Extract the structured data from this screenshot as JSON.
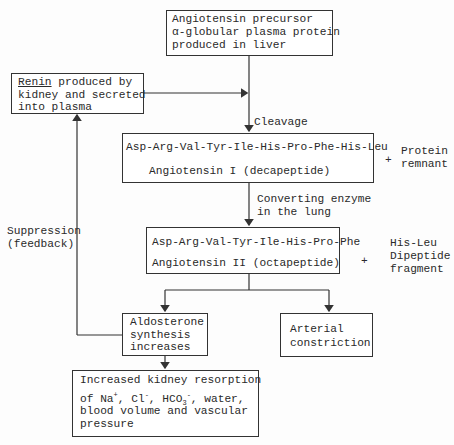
{
  "diagram": {
    "nodes": {
      "precursor": {
        "lines": [
          "Angiotensin precursor",
          "α-globular plasma protein",
          "produced in liver"
        ]
      },
      "renin": {
        "underlined": "Renin",
        "line1_rest": " produced by",
        "lines": [
          "kidney and secreted",
          "into plasma"
        ]
      },
      "angiotensin1": {
        "sequence_main": "Asp-Arg-Val-Tyr-Ile-His-Pro-Phe",
        "sequence_cleaved": "-His-Leu",
        "label": "Angiotensin I (decapeptide)"
      },
      "angiotensin2": {
        "sequence": "Asp-Arg-Val-Tyr-Ile-His-Pro-Phe",
        "label": "Angiotensin II (octapeptide)"
      },
      "aldosterone": {
        "lines": [
          "Aldosterone",
          "synthesis",
          "increases"
        ]
      },
      "arterial": {
        "lines": [
          "Arterial",
          "constriction"
        ]
      },
      "kidney": {
        "line1": "Increased kidney resorption",
        "line2_prefix": "of Na",
        "na_charge": "+",
        "cl": ", Cl",
        "cl_charge": "-",
        "hco": ", HCO",
        "hco_sub": "3",
        "hco_charge": "-",
        "line2_suffix": ", water,",
        "line3": "blood volume and vascular",
        "line4": "pressure"
      }
    },
    "side_products": {
      "protein_remnant": {
        "plus": "+",
        "lines": [
          "Protein",
          "remnant"
        ]
      },
      "his_leu": {
        "plus": "+",
        "lines": [
          "His-Leu",
          "Dipeptide",
          "fragment"
        ]
      }
    },
    "edge_labels": {
      "cleavage": "Cleavage",
      "converting_enzyme": [
        "Converting enzyme",
        "in the lung"
      ],
      "suppression": [
        "Suppression",
        "(feedback)"
      ]
    }
  }
}
